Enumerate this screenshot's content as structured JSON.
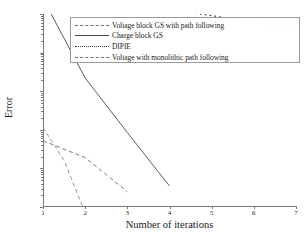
{
  "chart_data": {
    "type": "line",
    "title": "",
    "xlabel": "Number of iterations",
    "ylabel": "Error",
    "xscale": "linear",
    "yscale": "log",
    "xlim": [
      1,
      7
    ],
    "ylim": [
      0.0001,
      10
    ],
    "grid": false,
    "legend_position": "upper-center",
    "xticks": [
      "1",
      "2",
      "3",
      "4",
      "5",
      "6",
      "7"
    ],
    "ytick_labels": [
      "10¹",
      "10⁰",
      "10⁻¹",
      "10⁻²",
      "10⁻³",
      "10⁻⁴"
    ],
    "ytick_values": [
      10,
      1,
      0.1,
      0.01,
      0.001,
      0.0001
    ],
    "series": [
      {
        "name": "Voltage block GS with path following",
        "style": "dashed",
        "color": "#6b6b6b",
        "x": [
          1,
          2,
          3
        ],
        "values": [
          0.0052,
          0.0019,
          0.00025
        ]
      },
      {
        "name": "Charge block GS",
        "style": "solid",
        "color": "#4a4a4a",
        "x": [
          1,
          2,
          3,
          4
        ],
        "values": [
          25,
          0.22,
          0.0085,
          0.00035
        ]
      },
      {
        "name": "DIPIE",
        "style": "dotted",
        "color": "#3a3a3a",
        "x": [
          1,
          1.15,
          1.3,
          1.45,
          1.6,
          1.75,
          1.9,
          2.05,
          2.2,
          2.35,
          2.5,
          2.65,
          2.8,
          2.95,
          3.1,
          3.25,
          3.4,
          3.55,
          3.7,
          3.85,
          4.0,
          4.15,
          4.3,
          4.45,
          4.6,
          4.75,
          4.9,
          5.05,
          5.2,
          5.35,
          5.5,
          5.65,
          5.8,
          5.95,
          6.1,
          6.25,
          6.4,
          6.55,
          6.7,
          6.85,
          7.0
        ],
        "values": [
          25,
          24.2,
          23.5,
          23.0,
          22.4,
          21.8,
          21.2,
          20.6,
          20.0,
          19.4,
          18.8,
          18.2,
          17.6,
          17.0,
          16.4,
          15.8,
          15.2,
          14.6,
          14.0,
          13.4,
          12.8,
          12.2,
          11.6,
          11.0,
          10.4,
          9.9,
          9.4,
          8.9,
          8.4,
          7.9,
          7.5,
          7.1,
          6.7,
          6.3,
          5.9,
          5.6,
          5.3,
          5.0,
          4.7,
          4.4,
          4.1
        ]
      },
      {
        "name": "Voltage with monolithic path following",
        "style": "dashed",
        "color": "#8a8a8a",
        "x": [
          1,
          1.5,
          2
        ],
        "values": [
          0.0115,
          0.0016,
          7e-05
        ]
      }
    ]
  },
  "legend": {
    "entries": [
      "Voltage block GS with path following",
      "Charge block GS",
      "DIPIE",
      "Voltage with monolithic path following"
    ]
  },
  "axes": {
    "x_title": "Number of iterations",
    "y_title": "Error"
  }
}
